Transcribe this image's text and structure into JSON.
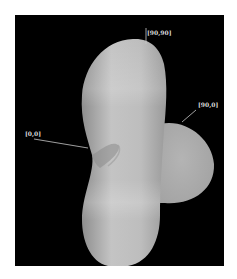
{
  "figure": {
    "background": "#000000",
    "surface_color": "#b8b8b8",
    "labels": [
      {
        "id": "top",
        "text": "[90,90]"
      },
      {
        "id": "right",
        "text": "[90,0]"
      },
      {
        "id": "left",
        "text": "[0,0]"
      }
    ]
  }
}
